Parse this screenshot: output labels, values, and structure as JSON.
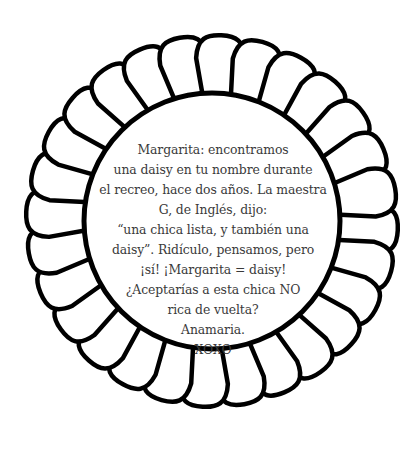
{
  "flower": {
    "center": [
      212,
      220
    ],
    "petal_count": 28,
    "outer_radius": 188,
    "inner_radius": 128,
    "stroke_color": "#000000",
    "fill_color": "#ffffff",
    "icon": "daisy-flower-outline"
  },
  "message": {
    "lines": [
      "Margarita: encontramos",
      "una daisy en tu nombre durante",
      "el recreo, hace dos años. La maestra",
      "G, de Inglés, dijo:",
      "“una chica lista, y también una",
      "daisy”. Ridículo, pensamos, pero",
      "¡sí! ¡Margarita = daisy!",
      "¿Aceptarías a esta chica NO",
      "rica de vuelta?",
      "Anamaria.",
      "XOXO"
    ]
  }
}
